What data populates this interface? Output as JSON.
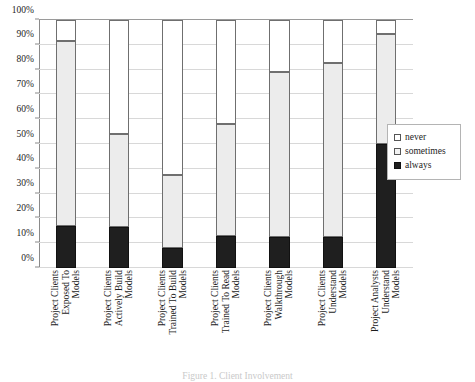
{
  "chart_data": {
    "type": "bar",
    "subtype": "stacked-100-percent",
    "title": "",
    "xlabel": "",
    "ylabel": "",
    "ylim": [
      0,
      100
    ],
    "y_unit": "%",
    "grid": true,
    "legend_position": "right",
    "orientation": "vertical",
    "categories": [
      "Project Clients Exposed To Models",
      "Project Clients Actively Build Models",
      "Project Clients Trained To Build Models",
      "Project Clients Trained To Read Models",
      "Project Clients Walkthrough Models",
      "Project Clients Understand Models",
      "Project Analysts Understand Models"
    ],
    "category_lines": [
      [
        "Project Clients",
        "Exposed To",
        "Models"
      ],
      [
        "Project Clients",
        "Actively Build",
        "Models"
      ],
      [
        "Project Clients",
        "Trained To Build",
        "Models"
      ],
      [
        "Project Clients",
        "Trained To Read",
        "Models"
      ],
      [
        "Project Clients",
        "Walkthrough",
        "Models"
      ],
      [
        "Project Clients",
        "Understand",
        "Models"
      ],
      [
        "Project Analysts",
        "Understand",
        "Models"
      ]
    ],
    "series": [
      {
        "name": "always",
        "color": "#1f1f1f",
        "values": [
          17.0,
          16.5,
          8.0,
          13.0,
          12.5,
          12.5,
          50.0
        ]
      },
      {
        "name": "sometimes",
        "color": "#ececec",
        "values": [
          74.5,
          37.5,
          29.5,
          45.0,
          66.5,
          70.0,
          44.5
        ]
      },
      {
        "name": "never",
        "color": "#ffffff",
        "values": [
          8.5,
          46.0,
          62.5,
          42.0,
          21.0,
          17.5,
          5.5
        ]
      }
    ],
    "cumulative_tops": {
      "always": [
        17.0,
        16.5,
        8.0,
        13.0,
        12.5,
        12.5,
        50.0
      ],
      "sometimes": [
        91.5,
        54.0,
        37.5,
        58.0,
        79.0,
        82.5,
        94.5
      ],
      "never": [
        100,
        100,
        100,
        100,
        100,
        100,
        100
      ]
    },
    "y_ticks": [
      {
        "value": 0,
        "label": "0%"
      },
      {
        "value": 10,
        "label": "10%"
      },
      {
        "value": 20,
        "label": "20%"
      },
      {
        "value": 30,
        "label": "30%"
      },
      {
        "value": 40,
        "label": "40%"
      },
      {
        "value": 50,
        "label": "50%"
      },
      {
        "value": 60,
        "label": "60%"
      },
      {
        "value": 70,
        "label": "70%"
      },
      {
        "value": 80,
        "label": "80%"
      },
      {
        "value": 90,
        "label": "90%"
      },
      {
        "value": 100,
        "label": "100%"
      }
    ]
  },
  "legend": {
    "items": [
      {
        "label": "never",
        "swatch": "never"
      },
      {
        "label": "sometimes",
        "swatch": "sometimes"
      },
      {
        "label": "always",
        "swatch": "always"
      }
    ]
  },
  "caption": {
    "text": "Figure 1. Client Involvement"
  },
  "colors": {
    "never": "#ffffff",
    "sometimes": "#ececec",
    "always": "#1f1f1f",
    "axis": "#8a8a8a",
    "grid": "#d8d8d8",
    "bar_outline": "#6f6f6f"
  }
}
